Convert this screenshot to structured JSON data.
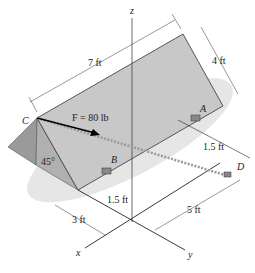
{
  "diagram": {
    "axes": {
      "x": "x",
      "y": "y",
      "z": "z"
    },
    "points": {
      "A": "A",
      "B": "B",
      "C": "C",
      "D": "D"
    },
    "force_label": "F = 80 lb",
    "dimensions": {
      "length_top": "7 ft",
      "width_right": "4 ft",
      "a_offset": "1.5 ft",
      "b_offset": "1.5 ft",
      "x_offset": "3 ft",
      "y_offset": "5 ft"
    },
    "angle": "45°",
    "colors": {
      "plate": "#c8c8c8",
      "side": "#9a9a9a",
      "shadow": "#dcdcdc",
      "line": "#222222"
    }
  }
}
